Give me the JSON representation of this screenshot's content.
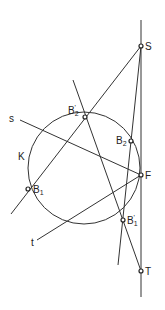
{
  "diagram": {
    "circle_label": "K",
    "points": {
      "S": {
        "label": "S",
        "sub": ""
      },
      "B2p": {
        "label": "B",
        "sub": "2",
        "prime": "'"
      },
      "B2": {
        "label": "B",
        "sub": "2",
        "prime": ""
      },
      "F": {
        "label": "F",
        "sub": ""
      },
      "B1": {
        "label": "B",
        "sub": "1",
        "prime": ""
      },
      "B1p": {
        "label": "B",
        "sub": "1",
        "prime": "'"
      },
      "T": {
        "label": "T",
        "sub": ""
      }
    },
    "lines": {
      "s": "s",
      "t": "t"
    }
  }
}
